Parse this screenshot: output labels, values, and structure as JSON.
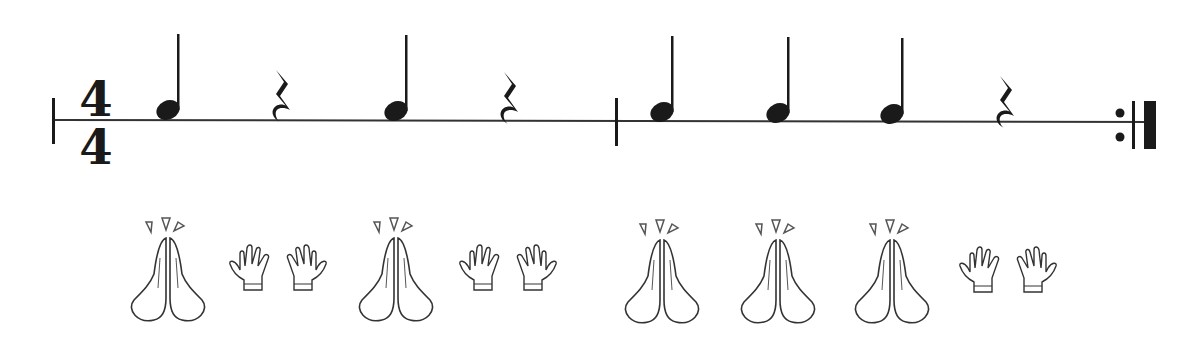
{
  "time_signature": {
    "top": "4",
    "bottom": "4"
  },
  "colors": {
    "ink": "#1a1a1a",
    "line": "#333333",
    "bg": "#ffffff"
  },
  "measures": [
    {
      "beats": [
        {
          "type": "quarter-note",
          "x": 168,
          "action": "clap"
        },
        {
          "type": "quarter-rest",
          "x": 282,
          "action": "rest"
        },
        {
          "type": "quarter-note",
          "x": 396,
          "action": "clap"
        },
        {
          "type": "quarter-rest",
          "x": 510,
          "action": "rest"
        }
      ]
    },
    {
      "beats": [
        {
          "type": "quarter-note",
          "x": 662,
          "action": "clap"
        },
        {
          "type": "quarter-note",
          "x": 778,
          "action": "clap"
        },
        {
          "type": "quarter-note",
          "x": 892,
          "action": "clap"
        },
        {
          "type": "quarter-rest",
          "x": 1006,
          "action": "rest"
        }
      ]
    }
  ],
  "legend": {
    "clap": "Clap",
    "rest": "Rest (open hands)"
  },
  "end_barline": "repeat"
}
